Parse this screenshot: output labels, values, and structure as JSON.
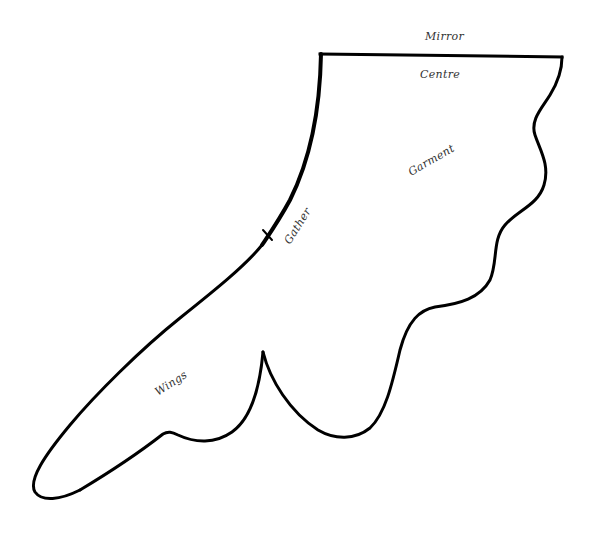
{
  "diagram": {
    "type": "sewing-pattern-piece",
    "labels": {
      "mirror": "Mirror",
      "centre": "Centre",
      "garment": "Garment",
      "gather": "Gather",
      "wings": "Wings"
    },
    "colors": {
      "outline": "#000000",
      "label": "#333333",
      "background": "#ffffff"
    }
  }
}
